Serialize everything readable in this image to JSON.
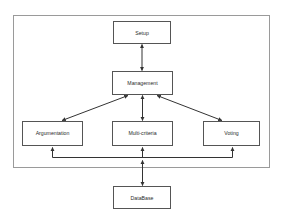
{
  "diagram": {
    "colors": {
      "background": "#ffffff",
      "box_stroke": "#555555",
      "container_stroke": "#9a9a9a",
      "connector": "#333333",
      "label_text": "#2b2b2b"
    },
    "container": {
      "name": "system-boundary",
      "x": 13,
      "y": 15,
      "width": 257,
      "height": 153
    },
    "nodes": [
      {
        "id": "setup",
        "label": "Setup",
        "x": 113,
        "y": 21,
        "width": 58,
        "height": 23
      },
      {
        "id": "management",
        "label": "Management",
        "x": 112,
        "y": 71,
        "width": 61,
        "height": 24
      },
      {
        "id": "argumentation",
        "label": "Argumentation",
        "x": 22,
        "y": 121,
        "width": 61,
        "height": 25
      },
      {
        "id": "multi_criteria",
        "label": "Multi-criteria",
        "x": 112,
        "y": 121,
        "width": 61,
        "height": 25
      },
      {
        "id": "voting",
        "label": "Voting",
        "x": 203,
        "y": 121,
        "width": 57,
        "height": 25
      },
      {
        "id": "database",
        "label": "DataBase",
        "x": 113,
        "y": 186,
        "width": 58,
        "height": 23
      }
    ],
    "edges": [
      {
        "id": "setup-management",
        "from": "setup",
        "to": "management",
        "style": "double-arrow",
        "direction": "vertical"
      },
      {
        "id": "management-argumentation",
        "from": "management",
        "to": "argumentation",
        "style": "double-arrow",
        "direction": "diagonal-left"
      },
      {
        "id": "management-multi-criteria",
        "from": "management",
        "to": "multi_criteria",
        "style": "double-arrow",
        "direction": "vertical"
      },
      {
        "id": "management-voting",
        "from": "management",
        "to": "voting",
        "style": "double-arrow",
        "direction": "diagonal-right"
      },
      {
        "id": "bus-argumentation",
        "from": "shared-bus",
        "to": "argumentation",
        "style": "single-arrow",
        "direction": "up"
      },
      {
        "id": "bus-multi-criteria",
        "from": "shared-bus",
        "to": "multi_criteria",
        "style": "single-arrow",
        "direction": "up"
      },
      {
        "id": "bus-voting",
        "from": "shared-bus",
        "to": "voting",
        "style": "single-arrow",
        "direction": "up"
      },
      {
        "id": "bus-database",
        "from": "shared-bus",
        "to": "database",
        "style": "double-arrow",
        "direction": "vertical"
      }
    ]
  }
}
